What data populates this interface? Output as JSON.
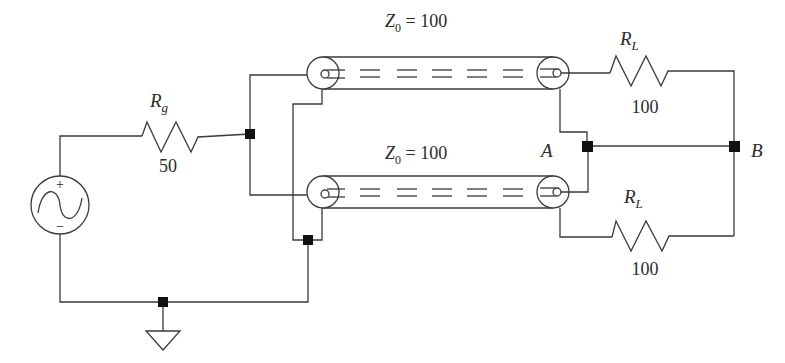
{
  "diagram": {
    "type": "circuit-schematic",
    "colors": {
      "line": "#3a3a3a",
      "node": "#111111",
      "background": "#ffffff",
      "text": "#2a2a2a"
    }
  },
  "source": {
    "name": "AC voltage source",
    "plus_sign": "+",
    "minus_sign": "−",
    "icon": "sine-wave-icon"
  },
  "generator_resistor": {
    "label_main": "R",
    "label_sub": "g",
    "value": "50"
  },
  "line_top": {
    "label_main": "Z",
    "label_sub": "0",
    "label_rest": " = 100"
  },
  "line_bottom": {
    "label_main": "Z",
    "label_sub": "0",
    "label_rest": " = 100"
  },
  "load_top": {
    "label_main": "R",
    "label_sub": "L",
    "value": "100"
  },
  "load_bottom": {
    "label_main": "R",
    "label_sub": "L",
    "value": "100"
  },
  "nodes": {
    "a_label": "A",
    "b_label": "B"
  },
  "ground": {
    "icon": "ground-icon"
  }
}
